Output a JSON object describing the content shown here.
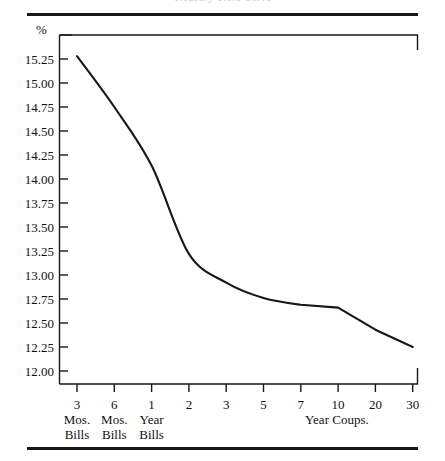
{
  "figure": {
    "name": "yield-curve-figure",
    "title_remnant": "Treasury Yield Curve",
    "unit_label": "%",
    "line_color": "#17171a",
    "axis_color": "#17171a",
    "background": "#ffffff"
  },
  "yaxis": {
    "ticks": [
      "15.25",
      "15.00",
      "14.75",
      "14.50",
      "14.25",
      "14.00",
      "13.75",
      "13.50",
      "13.25",
      "13.00",
      "12.75",
      "12.50",
      "12.25",
      "12.00"
    ]
  },
  "xaxis": {
    "ticks": [
      {
        "num": "3",
        "l1": "Mos.",
        "l2": "Bills"
      },
      {
        "num": "6",
        "l1": "Mos.",
        "l2": "Bills"
      },
      {
        "num": "1",
        "l1": "Year",
        "l2": "Bills"
      },
      {
        "num": "2",
        "l1": "",
        "l2": ""
      },
      {
        "num": "3",
        "l1": "",
        "l2": ""
      },
      {
        "num": "5",
        "l1": "",
        "l2": ""
      },
      {
        "num": "7",
        "l1": "",
        "l2": ""
      },
      {
        "num": "10",
        "l1": "",
        "l2": ""
      },
      {
        "num": "20",
        "l1": "",
        "l2": ""
      },
      {
        "num": "30",
        "l1": "",
        "l2": ""
      }
    ],
    "group_label_right": "Year Coups."
  },
  "chart_data": {
    "type": "line",
    "title": "Treasury Yield Curve",
    "xlabel": "",
    "ylabel": "%",
    "categories": [
      "3 Mos. Bills",
      "6 Mos. Bills",
      "1 Year Bills",
      "2",
      "3",
      "5",
      "7",
      "10",
      "20",
      "30"
    ],
    "x_tick_labels": [
      "3",
      "6",
      "1",
      "2",
      "3",
      "5",
      "7",
      "10",
      "20",
      "30"
    ],
    "values": [
      15.28,
      14.75,
      14.14,
      13.22,
      12.92,
      12.76,
      12.69,
      12.66,
      12.43,
      12.25
    ],
    "ylim": [
      11.9,
      15.4
    ],
    "y_ticks": [
      12.0,
      12.25,
      12.5,
      12.75,
      13.0,
      13.25,
      13.5,
      13.75,
      14.0,
      14.25,
      14.5,
      14.75,
      15.0,
      15.25
    ],
    "grid": false,
    "legend": false,
    "legend_position": "none",
    "series": [
      {
        "name": "Treasury yield",
        "values": [
          15.28,
          14.75,
          14.14,
          13.22,
          12.92,
          12.76,
          12.69,
          12.66,
          12.43,
          12.25
        ]
      }
    ]
  }
}
